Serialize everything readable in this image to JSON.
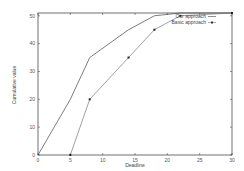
{
  "chart_data": {
    "type": "line",
    "title": "",
    "xlabel": "Deadline",
    "ylabel": "Cumulative value",
    "xlim": [
      0,
      30
    ],
    "ylim": [
      0,
      51
    ],
    "x_ticks": [
      0,
      5,
      10,
      15,
      20,
      25,
      30
    ],
    "y_ticks": [
      0,
      10,
      20,
      30,
      40,
      50
    ],
    "grid": false,
    "legend_position": "top-right",
    "series": [
      {
        "name": "Our approach",
        "style": "line",
        "color": "#444444",
        "x": [
          0,
          3,
          5,
          8,
          14,
          18,
          22,
          30
        ],
        "y": [
          0,
          12,
          20,
          35,
          45,
          50,
          51,
          51
        ]
      },
      {
        "name": "Basic approach",
        "style": "linespoints",
        "color": "#777777",
        "x": [
          5,
          8,
          14,
          18,
          22,
          30
        ],
        "y": [
          0,
          20,
          35,
          45,
          50,
          51
        ]
      }
    ]
  },
  "legend": {
    "items": [
      {
        "label": "Our approach"
      },
      {
        "label": "Basic approach"
      }
    ]
  },
  "axes": {
    "xlabel": "Deadline",
    "ylabel": "Cumulative value"
  }
}
